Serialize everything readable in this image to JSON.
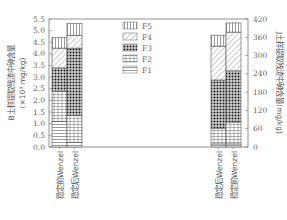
{
  "chart_data": {
    "type": "bar",
    "stacked": true,
    "title": "",
    "legend": [
      "F5",
      "F4",
      "F3",
      "F2",
      "F1"
    ],
    "legend_position": "center-top",
    "grid": false,
    "left_axis": {
      "label": "B土样提取残渣中砷含量",
      "unit_label": "(×10³ mg/kg)",
      "ylim": [
        0,
        5.5
      ],
      "ticks": [
        "0.0",
        "0.5",
        "1.0",
        "1.5",
        "2.0",
        "2.5",
        "3.0",
        "3.5",
        "4.0",
        "4.5",
        "5.0",
        "5.5"
      ]
    },
    "right_axis": {
      "label": "J土样提取残渣中砷含量(mg/kg)",
      "ylim": [
        0,
        420
      ],
      "ticks": [
        "0",
        "60",
        "120",
        "180",
        "240",
        "300",
        "360",
        "420"
      ]
    },
    "groups": [
      {
        "axis": "left",
        "categories": [
          "稳定前Wenzel",
          "稳定后Wenzel"
        ],
        "series": [
          {
            "name": "F1",
            "values": [
              1.1,
              0.2
            ]
          },
          {
            "name": "F2",
            "values": [
              1.3,
              1.15
            ]
          },
          {
            "name": "F3",
            "values": [
              1.0,
              2.9
            ]
          },
          {
            "name": "F4",
            "values": [
              0.85,
              0.55
            ]
          },
          {
            "name": "F5",
            "values": [
              0.45,
              0.5
            ]
          }
        ]
      },
      {
        "axis": "right",
        "categories": [
          "稳定后Wenzel",
          "稳定前Wenzel"
        ],
        "series": [
          {
            "name": "F1",
            "values": [
              10,
              10
            ]
          },
          {
            "name": "F2",
            "values": [
              52,
              72
            ]
          },
          {
            "name": "F3",
            "values": [
              158,
              168
            ]
          },
          {
            "name": "F4",
            "values": [
              111,
              127
            ]
          },
          {
            "name": "F5",
            "values": [
              36,
              30
            ]
          }
        ]
      }
    ]
  }
}
